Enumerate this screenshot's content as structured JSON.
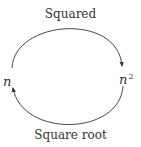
{
  "diagram": {
    "top_edge_label": "Squared",
    "bottom_edge_label": "Square root",
    "left_node": {
      "base": "n"
    },
    "right_node": {
      "base": "n",
      "exponent": "2"
    },
    "colors": {
      "stroke": "#333333",
      "text": "#333333",
      "background": "#ffffff"
    }
  }
}
